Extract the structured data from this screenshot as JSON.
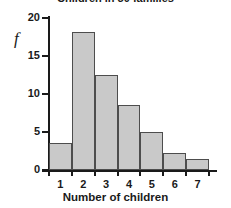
{
  "chart_data": {
    "type": "bar",
    "title": "Children in 50 families",
    "xlabel": "Number of children",
    "ylabel": "f",
    "categories": [
      "1",
      "2",
      "3",
      "4",
      "5",
      "6",
      "7"
    ],
    "values": [
      3.5,
      18.2,
      12.5,
      8.5,
      5.0,
      2.3,
      1.5
    ],
    "ylim": [
      0,
      20
    ],
    "yticks": [
      0,
      5,
      10,
      15,
      20
    ],
    "ytick_labels": [
      "0",
      "5",
      "10",
      "15",
      "20"
    ],
    "xlim": [
      0.5,
      7.5
    ],
    "grid": false,
    "legend": null,
    "bar_fill_color": "#c9c9c9",
    "bar_edge_color": "#4d4d4d",
    "axis_color": "#1a1a1a"
  }
}
